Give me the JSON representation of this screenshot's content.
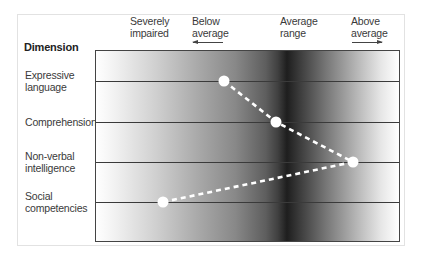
{
  "chart_data": {
    "type": "line",
    "title": "",
    "ylabel": "Dimension",
    "xlabel": "",
    "x_categories": [
      "Severely impaired",
      "Below average",
      "Average range",
      "Above average"
    ],
    "x_arrows": {
      "Below average": "left",
      "Above average": "right"
    },
    "categories": [
      "Expressive language",
      "Comprehension",
      "Non-verbal intelligence",
      "Social competencies"
    ],
    "series": [
      {
        "name": "Profile",
        "style": "white dashed line with white circular markers",
        "points": [
          {
            "dimension": "Expressive language",
            "position": "between Below average and Average range",
            "x_px": 224
          },
          {
            "dimension": "Comprehension",
            "position": "slightly below Average range",
            "x_px": 276
          },
          {
            "dimension": "Non-verbal intelligence",
            "position": "near Above average",
            "x_px": 353
          },
          {
            "dimension": "Social competencies",
            "position": "between Severely impaired and Below average",
            "x_px": 163
          }
        ]
      }
    ],
    "background": "horizontal grayscale gradient: white at left, darkest at Average range, white at right",
    "grid": "horizontal lines at each dimension",
    "legend": "none"
  },
  "header": {
    "dimension_title": "Dimension",
    "columns": [
      {
        "line1": "Severely",
        "line2": "impaired"
      },
      {
        "line1": "Below",
        "line2": "average",
        "arrow": "left"
      },
      {
        "line1": "Average",
        "line2": "range"
      },
      {
        "line1": "Above",
        "line2": "average",
        "arrow": "right"
      }
    ]
  },
  "rows": [
    {
      "line1": "Expressive",
      "line2": "language",
      "y": 81,
      "point_x": 224
    },
    {
      "line1": "Comprehension",
      "line2": "",
      "y": 122,
      "point_x": 276
    },
    {
      "line1": "Non-verbal",
      "line2": "intelligence",
      "y": 162,
      "point_x": 353
    },
    {
      "line1": "Social",
      "line2": "competencies",
      "y": 202,
      "point_x": 163
    }
  ],
  "colors": {
    "marker": "#ffffff",
    "line": "#ffffff",
    "gridline": "#3a3a3a",
    "border": "#444444"
  }
}
